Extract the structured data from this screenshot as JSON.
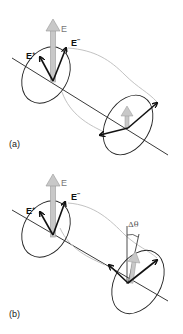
{
  "figure": {
    "panels": [
      {
        "id": "a",
        "label": "(a)",
        "vectors": {
          "E": "E",
          "E_plus": {
            "base": "E",
            "sup": "+"
          },
          "E_minus": {
            "base": "E",
            "sup": "−"
          }
        }
      },
      {
        "id": "b",
        "label": "(b)",
        "vectors": {
          "E": "E",
          "E_plus": {
            "base": "E",
            "sup": "+"
          },
          "E_minus": {
            "base": "E",
            "sup": "−"
          }
        },
        "rotation_label": "Δθ"
      }
    ],
    "colors": {
      "line": "#222222",
      "resultant_arrow_fill": "#c8c8c8",
      "resultant_arrow_stroke": "#999999",
      "helix_curve": "#bbbbbb",
      "text": "#111111",
      "E_label": "#777777"
    }
  }
}
